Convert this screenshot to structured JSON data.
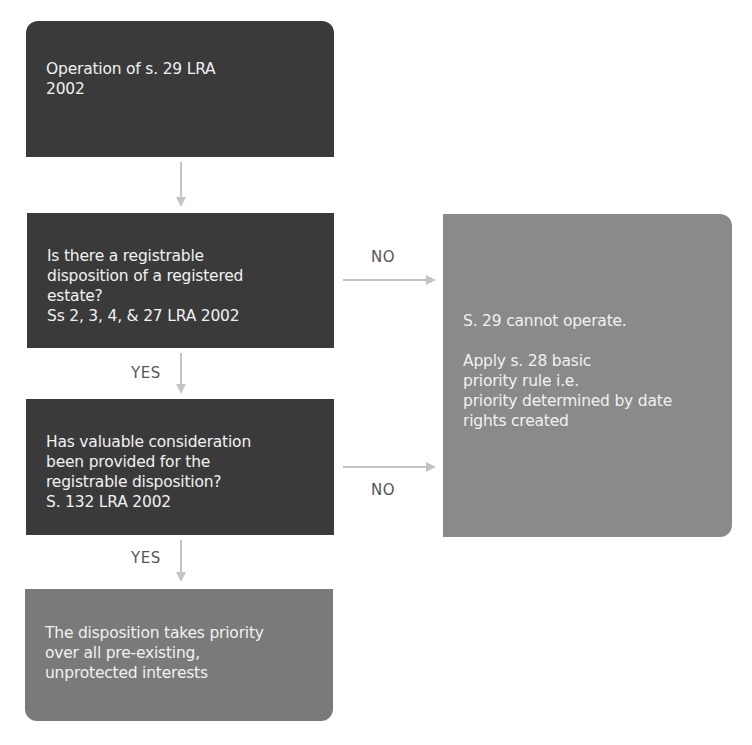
{
  "flowchart": {
    "start": {
      "lines": [
        "Operation of s. 29 LRA",
        "2002"
      ]
    },
    "question1": {
      "lines": [
        "Is there a registrable",
        "disposition of a registered",
        "estate?",
        "Ss 2, 3, 4, & 27 LRA 2002"
      ]
    },
    "question2": {
      "lines": [
        "Has valuable consideration",
        "been provided for the",
        "registrable disposition?",
        "S. 132 LRA 2002"
      ]
    },
    "outcome_yes": {
      "lines": [
        "The disposition takes priority",
        "over all pre-existing,",
        "unprotected interests"
      ]
    },
    "outcome_no": {
      "para1": "S. 29 cannot operate.",
      "para2_lines": [
        "Apply s. 28 basic",
        "priority rule i.e.",
        "priority determined by date",
        "rights created"
      ]
    },
    "labels": {
      "q1_no": "NO",
      "q1_yes": "YES",
      "q2_no": "NO",
      "q2_yes": "YES"
    },
    "colors": {
      "dark_box": "#3a3a3a",
      "result_box": "#7a7a7a",
      "side_box": "#8a8a8a",
      "arrow": "#c4c4c4"
    }
  }
}
